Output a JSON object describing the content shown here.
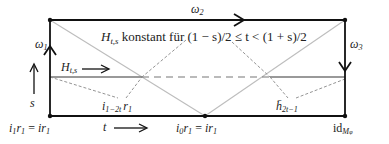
{
  "diagram": {
    "type": "homotopy-square",
    "corners": {
      "bottom_left": "i_1 r_1 = i r_1",
      "bottom_middle": "i_0 r_1 = i r_1",
      "bottom_right": "id_{M_φ}"
    },
    "edges": {
      "left": "ω₁",
      "top": "ω₂",
      "right": "ω₃"
    },
    "annotations": {
      "constant_note": "konstant für (1 − s)/2 ≤ t < (1 + s)/2",
      "constant_symbol": "H",
      "constant_sub": "t,s",
      "path_label_symbol": "H",
      "path_label_sub": "t,s",
      "s_axis": "s",
      "t_axis": "t",
      "left_triangle": "i",
      "left_triangle_sub": "1−2t",
      "left_triangle_tail": "r",
      "left_triangle_tail_sub": "1",
      "right_triangle": "h̄",
      "right_triangle_sub": "2t−1"
    },
    "labels": {
      "bl_a": "i",
      "bl_a_sub": "1",
      "bl_b": "r",
      "bl_b_sub": "1",
      "bl_eq": " = ",
      "bl_c": "ir",
      "bl_c_sub": "1",
      "bm_a": "i",
      "bm_a_sub": "0",
      "bm_b": "r",
      "bm_b_sub": "1",
      "bm_eq": " = ",
      "bm_c": "ir",
      "bm_c_sub": "1",
      "br_id": "id",
      "br_sub": "M",
      "br_subsub": "φ",
      "omega": "ω",
      "omega1_sub": "1",
      "omega2_sub": "2",
      "omega3_sub": "3"
    },
    "colors": {
      "frame": "#111111",
      "diagonal": "#bdbdbd",
      "middle_line": "#777777",
      "callout": "#777777"
    }
  }
}
